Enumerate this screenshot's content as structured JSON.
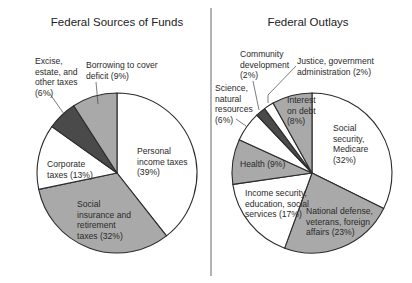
{
  "chart_data": [
    {
      "type": "pie",
      "title": "Federal Sources of Funds",
      "start_angle_deg": 0,
      "direction": "clockwise",
      "slices": [
        {
          "label": "Personal income taxes",
          "value": 39,
          "color": "#ffffff",
          "text_lines": [
            "Personal",
            "income taxes",
            "(39%)"
          ]
        },
        {
          "label": "Social insurance and retirement taxes",
          "value": 32,
          "color": "#a9a9a9",
          "text_lines": [
            "Social",
            "insurance and",
            "retirement",
            "taxes (32%)"
          ]
        },
        {
          "label": "Corporate taxes",
          "value": 13,
          "color": "#ffffff",
          "text_lines": [
            "Corporate",
            "taxes (13%)"
          ]
        },
        {
          "label": "Excise, estate, and other taxes",
          "value": 6,
          "color": "#4a4a4a",
          "text_lines": [
            "Excise,",
            "estate, and",
            "other taxes",
            "(6%)"
          ]
        },
        {
          "label": "Borrowing to cover deficit",
          "value": 9,
          "color": "#a9a9a9",
          "text_lines": [
            "Borrowing to cover",
            "deficit (9%)"
          ]
        }
      ]
    },
    {
      "type": "pie",
      "title": "Federal Outlays",
      "start_angle_deg": 0,
      "direction": "clockwise",
      "slices": [
        {
          "label": "Social security, Medicare",
          "value": 32,
          "color": "#ffffff",
          "text_lines": [
            "Social",
            "security,",
            "Medicare",
            "(32%)"
          ]
        },
        {
          "label": "National defense, veterans, foreign affairs",
          "value": 23,
          "color": "#a9a9a9",
          "text_lines": [
            "National defense,",
            "veterans, foreign",
            "affairs (23%)"
          ]
        },
        {
          "label": "Income security, education, social services",
          "value": 17,
          "color": "#ffffff",
          "text_lines": [
            "Income security,",
            "education, social",
            "services (17%)"
          ]
        },
        {
          "label": "Health",
          "value": 9,
          "color": "#a9a9a9",
          "text_lines": [
            "Health (9%)"
          ]
        },
        {
          "label": "Science, natural resources",
          "value": 6,
          "color": "#ffffff",
          "text_lines": [
            "Science,",
            "natural",
            "resources",
            "(6%)"
          ]
        },
        {
          "label": "Community development",
          "value": 2,
          "color": "#4a4a4a",
          "text_lines": [
            "Community",
            "development",
            "(2%)"
          ]
        },
        {
          "label": "Justice, government administration",
          "value": 2,
          "color": "#ffffff",
          "text_lines": [
            "Justice, government",
            "administration (2%)"
          ]
        },
        {
          "label": "Interest on debt",
          "value": 8,
          "color": "#a9a9a9",
          "text_lines": [
            "Interest",
            "on debt",
            "(8%)"
          ]
        }
      ]
    }
  ],
  "colors": {
    "outline": "#2b2b2b",
    "divider": "#8a8a8a",
    "white_slice": "#ffffff",
    "gray_slice": "#a9a9a9",
    "dark_slice": "#4a4a4a"
  }
}
